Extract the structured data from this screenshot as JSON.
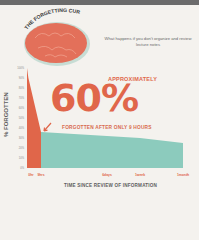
{
  "header": {
    "title": "THE FORGETTING CURVE",
    "subtitle": "What happens if you don't organize and review lecture notes"
  },
  "callout": {
    "prefix": "APPROXIMATELY",
    "value": "60%",
    "suffix": "FORGOTTEN AFTER ONLY 9 HOURS"
  },
  "colors": {
    "accent_red": "#e0664a",
    "teal": "#8ccbbd",
    "brain": "#e3705a",
    "topbar": "#6b6b6b"
  },
  "chart_data": {
    "type": "area",
    "title": "The Forgetting Curve",
    "xlabel": "TIME SINCE REVIEW OF INFORMATION",
    "ylabel": "% FORGOTTEN",
    "ylim": [
      0,
      100
    ],
    "yticks": [
      "100%",
      "90%",
      "80%",
      "70%",
      "60%",
      "50%",
      "40%",
      "30%",
      "20%",
      "10%",
      "0%"
    ],
    "xticks": [
      "0hr",
      "9hrs",
      "6days",
      "1week",
      "1month"
    ],
    "series": [
      {
        "name": "Retained (first 9 hours)",
        "color": "#e0664a",
        "x": [
          0,
          0.1,
          1
        ],
        "y": [
          100,
          90,
          36
        ]
      },
      {
        "name": "Retained after 9 hours",
        "color": "#8ccbbd",
        "x": [
          1,
          2,
          3,
          4,
          4.5
        ],
        "y": [
          36,
          32,
          30,
          25,
          22
        ]
      }
    ],
    "annotation": "Approximately 60% forgotten after only 9 hours",
    "grid": false,
    "legend": "none"
  }
}
